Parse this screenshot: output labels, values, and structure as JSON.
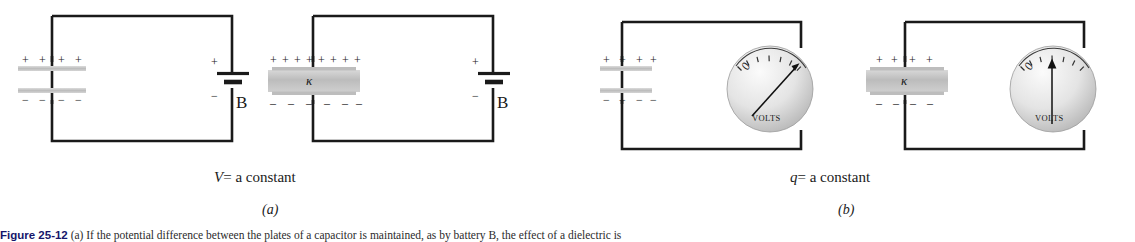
{
  "figure": {
    "caption_label": "Figure 25-12",
    "caption_text": "(a) If the potential difference between the plates of a capacitor is maintained, as by battery B, the effect of a dielectric is",
    "panels": [
      {
        "id": "a",
        "letter": "(a)",
        "condition": "V = a constant",
        "condition_symbol": "V",
        "condition_rest": "= a constant"
      },
      {
        "id": "b",
        "letter": "(b)",
        "condition": "q = a constant",
        "condition_symbol": "q",
        "condition_rest": "= a constant"
      }
    ],
    "circuits": [
      {
        "id": "circuit-a-left",
        "panel": "a",
        "has_dielectric": false,
        "dielectric_symbol": "",
        "source": "battery",
        "source_label": "B",
        "battery_plus_sign": "+",
        "battery_minus_sign": "−",
        "plus_signs": [
          "+",
          "+",
          "+",
          "+"
        ],
        "minus_signs": [
          "−",
          "−",
          "−",
          "−"
        ],
        "charge_count": 4
      },
      {
        "id": "circuit-a-right",
        "panel": "a",
        "has_dielectric": true,
        "dielectric_symbol": "κ",
        "source": "battery",
        "source_label": "B",
        "battery_plus_sign": "+",
        "battery_minus_sign": "−",
        "plus_signs": [
          "+",
          "+",
          "+",
          "+",
          "+",
          "+",
          "+",
          "+"
        ],
        "minus_signs": [
          "–",
          "–",
          "–",
          "–",
          "–",
          "–"
        ],
        "charge_count": 8
      },
      {
        "id": "circuit-b-left",
        "panel": "b",
        "has_dielectric": false,
        "dielectric_symbol": "",
        "source": "voltmeter",
        "meter_label": "VOLTS",
        "meter_zero": "0",
        "needle_reading": "high",
        "plus_signs": [
          "+",
          "+",
          "+",
          "+"
        ],
        "minus_signs": [
          "−",
          "−",
          "−",
          "−"
        ],
        "charge_count": 4
      },
      {
        "id": "circuit-b-right",
        "panel": "b",
        "has_dielectric": true,
        "dielectric_symbol": "κ",
        "source": "voltmeter",
        "meter_label": "VOLTS",
        "meter_zero": "0",
        "needle_reading": "low",
        "plus_signs": [
          "+",
          "+",
          "+",
          "+"
        ],
        "minus_signs": [
          "–",
          "–",
          "–",
          "–"
        ],
        "charge_count": 4
      }
    ],
    "colors": {
      "wire": "#1a1a1a",
      "plate_fill": "#c9c9c9",
      "dielectric_fill": "#c4c4c4",
      "meter_face_light": "#f2f2f2",
      "meter_face_dark": "#b9b9b9",
      "text": "#1a1a1a",
      "caption_label": "#16166b"
    }
  }
}
